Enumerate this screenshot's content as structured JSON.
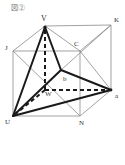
{
  "figure": {
    "title": "図②",
    "labels": {
      "V": "V",
      "K": "K",
      "J": "J",
      "C": "C",
      "U": "U",
      "N": "N",
      "a": "a",
      "W": "W",
      "b": "b"
    }
  },
  "colors": {
    "thin_line": "#8a8a8a",
    "bold_line": "#1a1a1a",
    "label": "#333333"
  }
}
